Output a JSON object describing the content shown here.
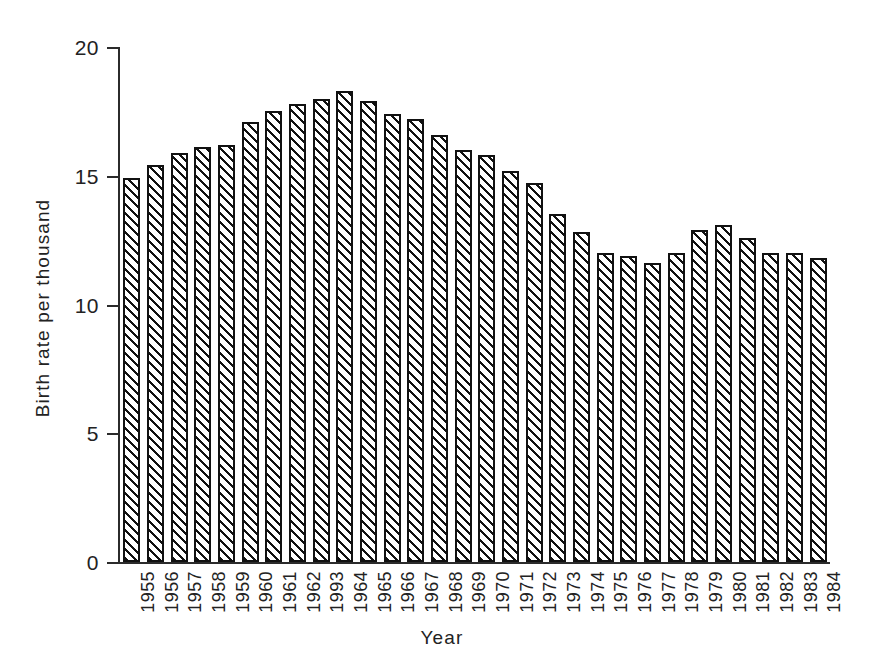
{
  "chart_data": {
    "type": "bar",
    "title": "",
    "subtitle": "",
    "xlabel": "Year",
    "ylabel": "Birth rate per thousand",
    "ylim": [
      0,
      20
    ],
    "yticks": [
      0,
      5,
      10,
      15,
      20
    ],
    "ytick_labels": [
      "0",
      "5",
      "10",
      "15",
      "20"
    ],
    "grid": false,
    "legend": null,
    "bar_style": {
      "fill": "diagonal-hatch",
      "edge_color": "#111111",
      "face_color": "#ffffff"
    },
    "categories": [
      "1955",
      "1956",
      "1957",
      "1958",
      "1959",
      "1960",
      "1961",
      "1962",
      "1993",
      "1964",
      "1965",
      "1966",
      "1967",
      "1968",
      "1969",
      "1970",
      "1971",
      "1972",
      "1973",
      "1974",
      "1975",
      "1976",
      "1977",
      "1978",
      "1979",
      "1980",
      "1981",
      "1982",
      "1983",
      "1984"
    ],
    "values": [
      14.9,
      15.4,
      15.9,
      16.1,
      16.2,
      17.1,
      17.5,
      17.8,
      18.0,
      18.3,
      17.9,
      17.4,
      17.2,
      16.6,
      16.0,
      15.8,
      15.2,
      14.7,
      13.5,
      12.8,
      12.0,
      11.9,
      11.6,
      12.0,
      12.9,
      13.1,
      12.6,
      12.0,
      12.0,
      11.8
    ]
  },
  "axes": {
    "y_title": "Birth rate per thousand",
    "x_title": "Year"
  }
}
